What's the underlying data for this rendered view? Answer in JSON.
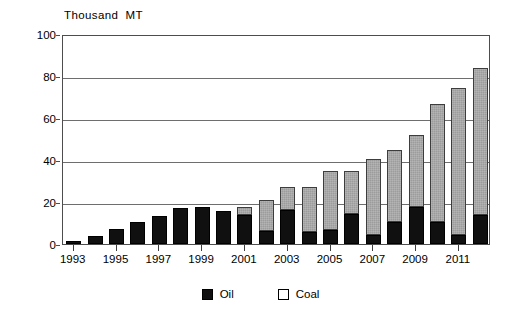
{
  "chart_data": {
    "type": "bar",
    "title": "",
    "subtitle": "",
    "xlabel": "",
    "ylabel": "Thousand  MT",
    "ylim": [
      0,
      100
    ],
    "yticks": [
      0,
      20,
      40,
      60,
      80,
      100
    ],
    "ytick_labels": [
      "0",
      "20",
      "40",
      "60",
      "80",
      "100"
    ],
    "grid": true,
    "stacked": true,
    "legend_position": "bottom-center",
    "categories": [
      "1993",
      "1994",
      "1995",
      "1996",
      "1997",
      "1998",
      "1999",
      "2000",
      "2001",
      "2002",
      "2003",
      "2004",
      "2005",
      "2006",
      "2007",
      "2008",
      "2009",
      "2010",
      "2011",
      "2012"
    ],
    "xtick_labels": [
      "1993",
      "1995",
      "1997",
      "1999",
      "2001",
      "2003",
      "2005",
      "2007",
      "2009",
      "2011"
    ],
    "series": [
      {
        "name": "Oil",
        "color": "#101010",
        "values": [
          1.5,
          4,
          7,
          10.5,
          13.5,
          17,
          17.5,
          15.5,
          14,
          6,
          16,
          5.5,
          6.5,
          14.5,
          4.5,
          10.5,
          17.5,
          10.5,
          4.5,
          14
        ]
      },
      {
        "name": "Coal",
        "color": "#9c9c9c",
        "values": [
          0,
          0,
          0,
          0,
          0,
          0,
          0,
          0,
          3.5,
          15,
          11,
          21.5,
          28.5,
          20.5,
          36,
          34.5,
          34.5,
          56,
          70,
          70
        ]
      }
    ],
    "totals": [
      1.5,
      4,
      7,
      10.5,
      13.5,
      17,
      17.5,
      15.5,
      17.5,
      21,
      27,
      27,
      35,
      35,
      40.5,
      45,
      52,
      66.5,
      74.5,
      84
    ]
  },
  "legend": {
    "entries": [
      {
        "label": "Oil",
        "swatch": "black-filled-square"
      },
      {
        "label": "Coal",
        "swatch": "white-outlined-square"
      }
    ]
  }
}
